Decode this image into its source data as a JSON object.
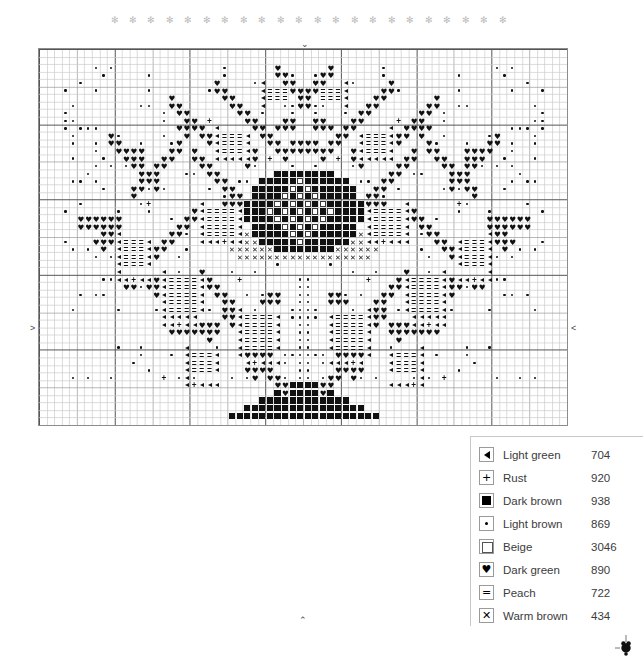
{
  "chart": {
    "grid": {
      "cols": 70,
      "rows": 50,
      "cell_px": 7.57,
      "minor_color": "#cccccc",
      "mid_color": "#9a9a9a",
      "major_color": "#555555",
      "mid_every": 5,
      "major_every": 10
    },
    "center_markers": {
      "top": "⌄",
      "bottom": "⌃",
      "left": ">",
      "right": "<"
    },
    "decor": {
      "flake_glyph": "✻",
      "flake_count": 22,
      "flake_color": "#b9b9b9"
    }
  },
  "legend": {
    "rows": [
      {
        "symbol": "tri",
        "name": "Light green",
        "code": "704"
      },
      {
        "symbol": "plus",
        "name": "Rust",
        "code": "920"
      },
      {
        "symbol": "fsq",
        "name": "Dark brown",
        "code": "938"
      },
      {
        "symbol": "dot",
        "name": "Light brown",
        "code": "869"
      },
      {
        "symbol": "osq",
        "name": "Beige",
        "code": "3046"
      },
      {
        "symbol": "heart",
        "name": "Dark green",
        "code": "890"
      },
      {
        "symbol": "eq",
        "name": "Peach",
        "code": "722"
      },
      {
        "symbol": "x",
        "name": "Warm brown",
        "code": "434"
      }
    ],
    "glyphs": {
      "tri": "",
      "plus": "+",
      "fsq": "",
      "dot": "",
      "osq": "",
      "heart": "♥",
      "eq": "=",
      "x": "✕"
    }
  },
  "chart_data": {
    "type": "heatmap",
    "xlabel": "",
    "ylabel": "",
    "grid": true,
    "legend_position": "bottom-right",
    "palette": {
      "tri": {
        "name": "Light green",
        "code": "704"
      },
      "plus": {
        "name": "Rust",
        "code": "920"
      },
      "fsq": {
        "name": "Dark brown",
        "code": "938"
      },
      "dot": {
        "name": "Light brown",
        "code": "869"
      },
      "osq": {
        "name": "Beige",
        "code": "3046"
      },
      "heart": {
        "name": "Dark green",
        "code": "890"
      },
      "eq": {
        "name": "Peach",
        "code": "722"
      },
      "x": {
        "name": "Warm brown",
        "code": "434"
      }
    },
    "cols": 70,
    "rows": 50,
    "motif": "stylised tree with heart foliage, dark-brown trunk crown, dotted trunk and stepped triangular base",
    "regions": [
      {
        "id": "trunk",
        "symbol": "dot",
        "x": 34,
        "y": 30,
        "w": 2,
        "h": 18,
        "desc": "two-cell wide dotted trunk running down to the base"
      },
      {
        "id": "base",
        "symbol": "fsq",
        "x": 26,
        "y": 44,
        "w": 18,
        "h": 5,
        "desc": "stepped triangular tree base of dark-brown squares"
      },
      {
        "id": "core",
        "symbol": "fsq",
        "x": 29,
        "y": 16,
        "w": 13,
        "h": 12,
        "desc": "dark-brown dense crown centre"
      },
      {
        "id": "core-beige",
        "symbol": "osq",
        "x": 31,
        "y": 21,
        "w": 8,
        "h": 6,
        "desc": "beige open squares inside the crown"
      },
      {
        "id": "core-x",
        "symbol": "x",
        "x": 28,
        "y": 24,
        "w": 16,
        "h": 5,
        "desc": "warm-brown X band under the crown"
      },
      {
        "id": "foliage",
        "symbol": "heart",
        "x": 4,
        "y": 1,
        "w": 62,
        "h": 46,
        "desc": "dark-green hearts forming the outer branch tips"
      },
      {
        "id": "peach-bands",
        "symbol": "eq",
        "x": 10,
        "y": 12,
        "w": 50,
        "h": 34,
        "desc": "peach equals-sign bands inside the branches"
      },
      {
        "id": "green-edges",
        "symbol": "tri",
        "x": 8,
        "y": 12,
        "w": 54,
        "h": 36,
        "desc": "light-green triangles edging the branches"
      },
      {
        "id": "rust-accents",
        "symbol": "plus",
        "x": 10,
        "y": 20,
        "w": 50,
        "h": 26,
        "desc": "scattered rust plus accents"
      },
      {
        "id": "brown-speckle",
        "symbol": "dot",
        "x": 6,
        "y": 2,
        "w": 58,
        "h": 44,
        "desc": "light-brown dotted speckle between branches"
      }
    ]
  }
}
